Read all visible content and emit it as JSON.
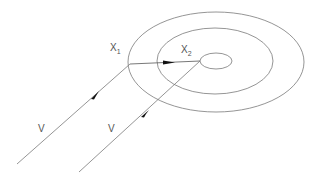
{
  "diagram": {
    "type": "concentric-ellipses-with-vectors",
    "colors": {
      "stroke": "#7a7a7a",
      "arrow": "#111111",
      "text": "#555555",
      "background": "#ffffff"
    },
    "ellipses": [
      {
        "name": "outer",
        "cx": 216,
        "cy": 62,
        "rx": 88,
        "ry": 50
      },
      {
        "name": "middle",
        "cx": 215,
        "cy": 61,
        "rx": 58,
        "ry": 33
      },
      {
        "name": "inner",
        "cx": 216,
        "cy": 61,
        "rx": 16,
        "ry": 8
      }
    ],
    "labels": {
      "x1": {
        "base": "X",
        "sub": "1"
      },
      "x2": {
        "base": "X",
        "sub": "2"
      },
      "v_left": "V",
      "v_right": "V"
    }
  }
}
